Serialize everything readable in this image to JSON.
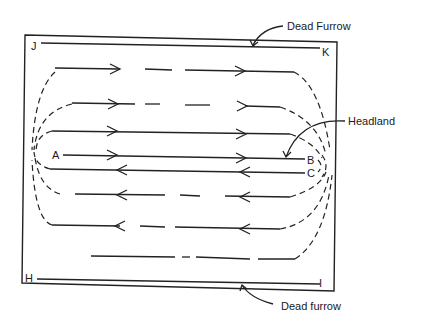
{
  "diagram": {
    "labels": {
      "dead_furrow_top": "Dead Furrow",
      "dead_furrow_bottom": "Dead furrow",
      "headland": "Headland"
    },
    "corner_points": {
      "J": "J",
      "K": "K",
      "H": "H",
      "I": "I"
    },
    "path_points": {
      "A": "A",
      "B": "B",
      "C": "C"
    },
    "colors": {
      "ink": "#222222",
      "background": "#ffffff"
    }
  }
}
